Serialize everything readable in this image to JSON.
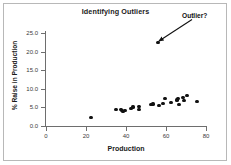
{
  "chart_data": {
    "type": "scatter",
    "title": "Identifying Outliers",
    "xlabel": "Production",
    "ylabel": "% Raise in Production",
    "xlim": [
      0,
      80
    ],
    "ylim": [
      0.0,
      25.0
    ],
    "xticks": [
      "0",
      "20",
      "40",
      "60",
      "80"
    ],
    "xtick_values": [
      0,
      20,
      40,
      60,
      80
    ],
    "yticks": [
      "0.0",
      "5.0",
      "10.0",
      "15.0",
      "20.0",
      "25.0"
    ],
    "ytick_values": [
      0.0,
      5.0,
      10.0,
      15.0,
      20.0,
      25.0
    ],
    "grid": false,
    "legend": false,
    "marker_color": "#111111",
    "points": [
      {
        "x": 22.5,
        "y": 2.2
      },
      {
        "x": 35.0,
        "y": 4.4
      },
      {
        "x": 37.5,
        "y": 4.5
      },
      {
        "x": 38.0,
        "y": 4.1
      },
      {
        "x": 38.5,
        "y": 3.9
      },
      {
        "x": 39.5,
        "y": 4.2
      },
      {
        "x": 42.5,
        "y": 4.6
      },
      {
        "x": 43.5,
        "y": 5.1
      },
      {
        "x": 46.5,
        "y": 5.2
      },
      {
        "x": 46.5,
        "y": 4.4
      },
      {
        "x": 52.5,
        "y": 5.8
      },
      {
        "x": 53.5,
        "y": 5.9
      },
      {
        "x": 56.0,
        "y": 22.5
      },
      {
        "x": 56.5,
        "y": 5.6
      },
      {
        "x": 58.5,
        "y": 6.1
      },
      {
        "x": 59.5,
        "y": 7.4
      },
      {
        "x": 62.5,
        "y": 6.3
      },
      {
        "x": 65.5,
        "y": 7.0
      },
      {
        "x": 66.0,
        "y": 7.3
      },
      {
        "x": 66.5,
        "y": 5.8
      },
      {
        "x": 68.5,
        "y": 7.6
      },
      {
        "x": 69.0,
        "y": 6.9
      },
      {
        "x": 70.5,
        "y": 8.2
      },
      {
        "x": 75.5,
        "y": 6.5
      }
    ],
    "annotations": [
      {
        "text": "Outlier?",
        "points_to_x": 56.0,
        "points_to_y": 22.5,
        "arrow": true
      }
    ]
  }
}
